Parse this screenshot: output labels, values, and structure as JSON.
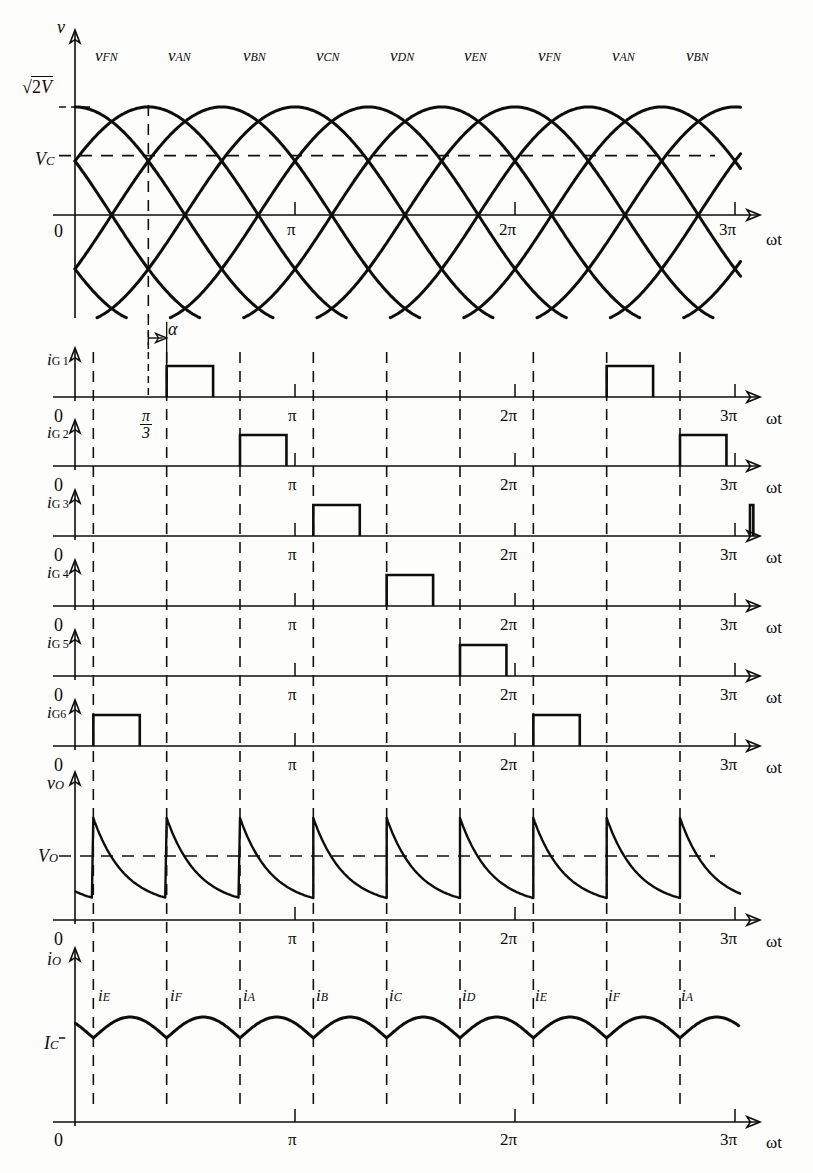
{
  "figure": {
    "background": "#fdfdfb",
    "ink": "#0d0d0d"
  },
  "axis_labels": {
    "omega_t": "ωt",
    "zero": "0",
    "pi": "π",
    "two_pi": "2π",
    "three_pi": "3π",
    "pi_over_3_num": "π",
    "pi_over_3_den": "3",
    "alpha": "α"
  },
  "panels": [
    {
      "id": "supply-voltage",
      "y_axis_label": "v",
      "y_markers": [
        {
          "text_prefix": "√",
          "text_body": "2V",
          "kind": "sqrt2V"
        },
        {
          "text": "V",
          "sub": "C",
          "kind": "Vc"
        }
      ],
      "phase_labels": [
        "v_FN",
        "v_AN",
        "v_BN",
        "v_CN",
        "v_DN",
        "v_EN",
        "v_FN",
        "v_AN",
        "v_BN"
      ],
      "phase_label_text": [
        {
          "base": "v",
          "sub": "FN"
        },
        {
          "base": "v",
          "sub": "AN"
        },
        {
          "base": "v",
          "sub": "BN"
        },
        {
          "base": "v",
          "sub": "CN"
        },
        {
          "base": "v",
          "sub": "DN"
        },
        {
          "base": "v",
          "sub": "EN"
        },
        {
          "base": "v",
          "sub": "FN"
        },
        {
          "base": "v",
          "sub": "AN"
        },
        {
          "base": "v",
          "sub": "BN"
        }
      ],
      "x_ticks": [
        "0",
        "π",
        "2π",
        "3π"
      ]
    },
    {
      "id": "ig1",
      "y_axis_label_base": "i",
      "y_axis_label_sub": "G 1"
    },
    {
      "id": "ig2",
      "y_axis_label_base": "i",
      "y_axis_label_sub": "G 2"
    },
    {
      "id": "ig3",
      "y_axis_label_base": "i",
      "y_axis_label_sub": "G 3"
    },
    {
      "id": "ig4",
      "y_axis_label_base": "i",
      "y_axis_label_sub": "G 4"
    },
    {
      "id": "ig5",
      "y_axis_label_base": "i",
      "y_axis_label_sub": "G 5"
    },
    {
      "id": "ig6",
      "y_axis_label_base": "i",
      "y_axis_label_sub": "G6"
    },
    {
      "id": "output-voltage",
      "y_axis_label_base": "v",
      "y_axis_label_sub": "O",
      "level_label_base": "V",
      "level_label_sub": "O"
    },
    {
      "id": "output-current",
      "y_axis_label_base": "i",
      "y_axis_label_sub": "O",
      "level_label_base": "I",
      "level_label_sub": "C"
    }
  ],
  "current_segment_labels": [
    {
      "base": "i",
      "sub": "E"
    },
    {
      "base": "i",
      "sub": "F"
    },
    {
      "base": "i",
      "sub": "A"
    },
    {
      "base": "i",
      "sub": "B"
    },
    {
      "base": "i",
      "sub": "C"
    },
    {
      "base": "i",
      "sub": "D"
    },
    {
      "base": "i",
      "sub": "E"
    },
    {
      "base": "i",
      "sub": "F"
    },
    {
      "base": "i",
      "sub": "A"
    }
  ],
  "chart_data": {
    "type": "line",
    "xlabel": "ωt",
    "x_unit": "radians",
    "xlim": [
      0,
      9.4248
    ],
    "x_tick_values": [
      0,
      3.14159,
      6.28318,
      9.42477
    ],
    "x_tick_labels": [
      "0",
      "π",
      "2π",
      "3π"
    ],
    "firing_angle_alpha_deg": 15,
    "commutation_interval_deg": 60,
    "phase_count": 6,
    "supply": {
      "ylabel": "v",
      "y_tick_labels": [
        "√2V",
        "V_C",
        "0"
      ],
      "peak_value_label": "√2V",
      "control_level_label": "V_C",
      "control_level_fraction_of_peak": 0.55,
      "series": [
        {
          "name": "v_AN",
          "phase_deg": 60,
          "amplitude_label": "√2V"
        },
        {
          "name": "v_BN",
          "phase_deg": 120,
          "amplitude_label": "√2V"
        },
        {
          "name": "v_CN",
          "phase_deg": 180,
          "amplitude_label": "√2V"
        },
        {
          "name": "v_DN",
          "phase_deg": 240,
          "amplitude_label": "√2V"
        },
        {
          "name": "v_EN",
          "phase_deg": 300,
          "amplitude_label": "√2V"
        },
        {
          "name": "v_FN",
          "phase_deg": 0,
          "amplitude_label": "√2V"
        }
      ],
      "segment_labels_deg": [
        30,
        90,
        150,
        210,
        270,
        330,
        390,
        450,
        510
      ],
      "segment_labels": [
        "v_FN",
        "v_AN",
        "v_BN",
        "v_CN",
        "v_DN",
        "v_EN",
        "v_FN",
        "v_AN",
        "v_BN"
      ]
    },
    "gate_pulses": [
      {
        "name": "i_G1",
        "pulse_width_deg": 38,
        "starts_deg": [
          75,
          435
        ]
      },
      {
        "name": "i_G2",
        "pulse_width_deg": 38,
        "starts_deg": [
          135,
          495
        ]
      },
      {
        "name": "i_G3",
        "pulse_width_deg": 38,
        "starts_deg": [
          195,
          555
        ]
      },
      {
        "name": "i_G4",
        "pulse_width_deg": 38,
        "starts_deg": [
          255
        ]
      },
      {
        "name": "i_G5",
        "pulse_width_deg": 38,
        "starts_deg": [
          -45,
          315
        ]
      },
      {
        "name": "i_G6",
        "pulse_width_deg": 38,
        "starts_deg": [
          15,
          375
        ]
      }
    ],
    "output_voltage": {
      "ylabel": "v_O",
      "mean_level_label": "V_O",
      "waveform": "decaying-exponential-sawtooth",
      "period_deg": 60,
      "segments": 9
    },
    "output_current": {
      "ylabel": "i_O",
      "min_level_label": "I_C",
      "waveform": "ripple-arcs",
      "period_deg": 60,
      "segments": 9,
      "segment_labels": [
        "i_E",
        "i_F",
        "i_A",
        "i_B",
        "i_C",
        "i_D",
        "i_E",
        "i_F",
        "i_A"
      ]
    }
  }
}
